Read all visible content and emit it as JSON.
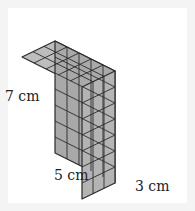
{
  "figure": {
    "dimensions": {
      "length": 5,
      "width": 3,
      "height": 7,
      "unit": "cm"
    },
    "labels": {
      "height": "7 cm",
      "length": "5 cm",
      "width": "3 cm"
    },
    "colors": {
      "top_face": "#bdbdbd",
      "front_face": "#a9a9a9",
      "side_face": "#b4b4b4",
      "grid_lines": "#2a2a2a",
      "background": "#ffffff"
    }
  }
}
